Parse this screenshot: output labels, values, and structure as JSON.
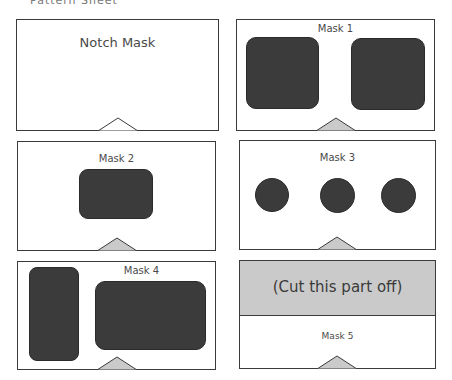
{
  "heading": "Pattern Sheet",
  "colors": {
    "border": "#3a3a3a",
    "mask_fill": "#3b3b3b",
    "notch_fill": "#cacaca",
    "cut_fill": "#cacaca"
  },
  "panels": [
    {
      "label": "Notch Mask"
    },
    {
      "label": "Mask 1"
    },
    {
      "label": "Mask 2"
    },
    {
      "label": "Mask 3"
    },
    {
      "label": "Mask 4"
    },
    {
      "label": "Mask 5",
      "cut_label": "(Cut this part off)"
    }
  ]
}
